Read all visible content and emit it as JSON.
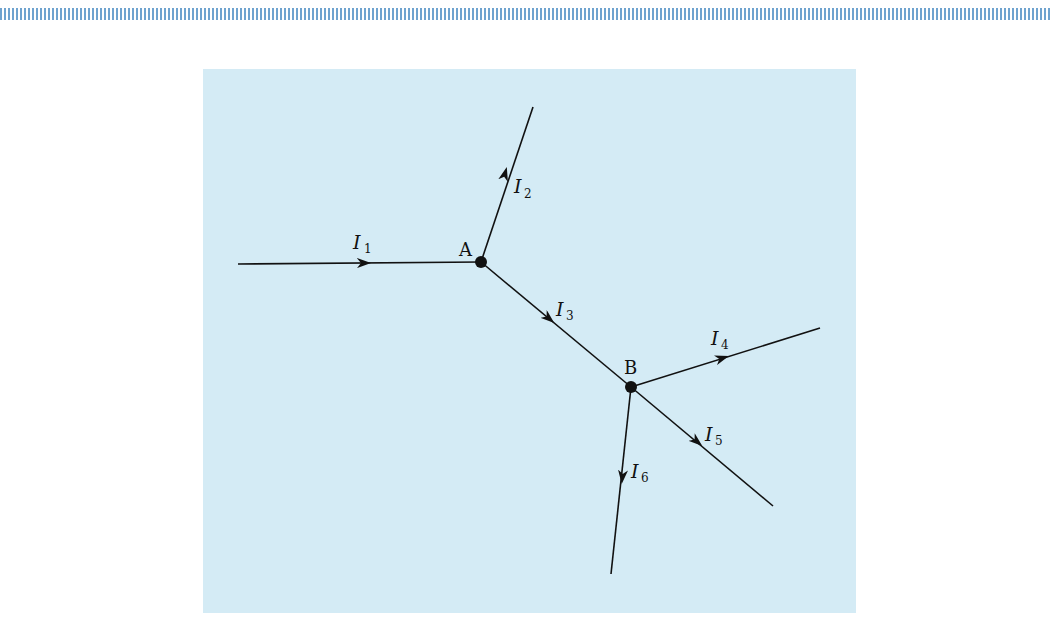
{
  "header": {
    "decoration": "striped-bar"
  },
  "figure": {
    "background_color": "#d4ebf5",
    "line_color": "#111111",
    "nodes": [
      {
        "id": "A",
        "label": "A",
        "x": 481,
        "y": 262
      },
      {
        "id": "B",
        "label": "B",
        "x": 631,
        "y": 387
      }
    ],
    "branches": [
      {
        "name": "I",
        "sub": "1",
        "from": [
          238,
          264
        ],
        "to": [
          481,
          262
        ],
        "direction": "into A"
      },
      {
        "name": "I",
        "sub": "2",
        "from": [
          481,
          262
        ],
        "to": [
          533,
          107
        ],
        "direction": "out of A"
      },
      {
        "name": "I",
        "sub": "3",
        "from": [
          481,
          262
        ],
        "to": [
          631,
          387
        ],
        "direction": "A to B"
      },
      {
        "name": "I",
        "sub": "4",
        "from": [
          631,
          387
        ],
        "to": [
          820,
          328
        ],
        "direction": "out of B"
      },
      {
        "name": "I",
        "sub": "5",
        "from": [
          631,
          387
        ],
        "to": [
          773,
          506
        ],
        "direction": "out of B"
      },
      {
        "name": "I",
        "sub": "6",
        "from": [
          631,
          387
        ],
        "to": [
          611,
          574
        ],
        "direction": "out of B"
      }
    ],
    "labels": {
      "node_a": "A",
      "node_b": "B",
      "i1": "I",
      "i1_sub": "1",
      "i2": "I",
      "i2_sub": "2",
      "i3": "I",
      "i3_sub": "3",
      "i4": "I",
      "i4_sub": "4",
      "i5": "I",
      "i5_sub": "5",
      "i6": "I",
      "i6_sub": "6"
    }
  }
}
